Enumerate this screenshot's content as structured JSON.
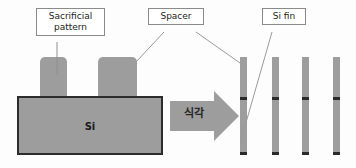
{
  "figure": {
    "type": "process-flow-cross-section",
    "topic": "Spacer patterning / sidewall image transfer for Si fin formation"
  },
  "callouts": [
    {
      "id": "sacrificial",
      "label": "Sacrificial\npattern"
    },
    {
      "id": "spacer",
      "label": "Spacer"
    },
    {
      "id": "sifin",
      "label": "Si fin"
    }
  ],
  "left_stage": {
    "substrate_label": "Si",
    "pillar_count": 2
  },
  "arrow": {
    "label": "식각",
    "direction": "right"
  },
  "right_stage": {
    "fin_count": 4,
    "fins": [
      {
        "index": 1
      },
      {
        "index": 2
      },
      {
        "index": 3
      },
      {
        "index": 4
      }
    ]
  },
  "colors": {
    "material_gray": "#9d9d9d",
    "outline_dark": "#2c2c2c",
    "band_dark": "#2a2a2a",
    "callout_border": "#8a8a8a",
    "leader_line": "#9a9a9a",
    "background": "#fdfdfd"
  }
}
